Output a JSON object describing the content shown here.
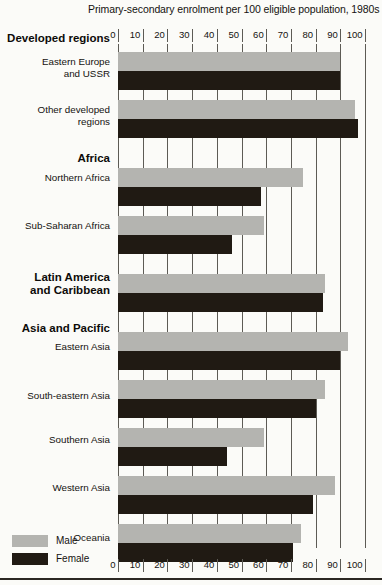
{
  "chart_data": {
    "type": "bar",
    "orientation": "horizontal",
    "title": "Primary-secondary enrolment per 100 eligible population, 1980s",
    "xlabel": "",
    "ylabel": "",
    "xlim": [
      0,
      100
    ],
    "xticks": [
      0,
      10,
      20,
      30,
      40,
      50,
      60,
      70,
      80,
      90,
      100
    ],
    "grid": true,
    "axis_position": "both",
    "legend": [
      "Male",
      "Female"
    ],
    "legend_position": "bottom-left",
    "series": [
      {
        "name": "Male",
        "color": "#b4b4b0",
        "values": [
          90,
          96,
          75,
          59,
          84,
          93,
          84,
          59,
          88,
          74
        ]
      },
      {
        "name": "Female",
        "color": "#201a13",
        "values": [
          90,
          97,
          58,
          46,
          83,
          90,
          80,
          44,
          79,
          71
        ]
      }
    ],
    "categories": [
      "Eastern Europe and USSR",
      "Other developed regions",
      "Northern Africa",
      "Sub-Saharan Africa",
      "Latin America and Caribbean",
      "Eastern Asia",
      "South-eastern Asia",
      "Southern Asia",
      "Western Asia",
      "Oceania"
    ],
    "groups": [
      {
        "header": "Developed regions",
        "rows": [
          "Eastern Europe and USSR",
          "Other developed regions"
        ]
      },
      {
        "header": "Africa",
        "rows": [
          "Northern Africa",
          "Sub-Saharan Africa"
        ]
      },
      {
        "header": "Latin America and Caribbean",
        "rows": []
      },
      {
        "header": "Asia and Pacific",
        "rows": [
          "Eastern Asia",
          "South-eastern Asia",
          "Southern Asia",
          "Western Asia",
          "Oceania"
        ]
      }
    ]
  },
  "labels": {
    "group_developed": "Developed regions",
    "row_eastern_europe_l1": "Eastern Europe",
    "row_eastern_europe_l2": "and USSR",
    "row_other_developed_l1": "Other developed",
    "row_other_developed_l2": "regions",
    "group_africa": "Africa",
    "row_northern_africa": "Northern Africa",
    "row_sub_saharan_africa": "Sub-Saharan Africa",
    "group_latin_america_l1": "Latin America",
    "group_latin_america_l2": "and Caribbean",
    "group_asia_pacific": "Asia and Pacific",
    "row_eastern_asia": "Eastern Asia",
    "row_south_eastern_asia": "South-eastern Asia",
    "row_southern_asia": "Southern Asia",
    "row_western_asia": "Western Asia",
    "row_oceania": "Oceania"
  },
  "legend": {
    "male": "Male",
    "female": "Female"
  },
  "ticks": {
    "t0": "0",
    "t10": "10",
    "t20": "20",
    "t30": "30",
    "t40": "40",
    "t50": "50",
    "t60": "60",
    "t70": "70",
    "t80": "80",
    "t90": "90",
    "t100": "100"
  }
}
